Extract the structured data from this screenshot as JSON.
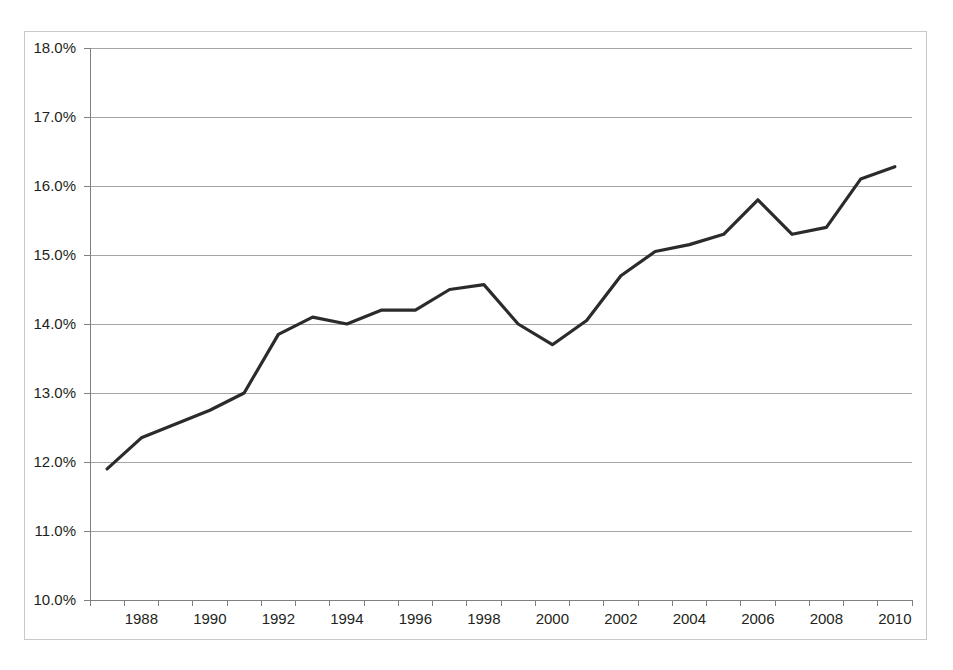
{
  "chart_data": {
    "type": "line",
    "title": "",
    "subtitle": "",
    "xlabel": "",
    "ylabel": "",
    "x": [
      1987,
      1988,
      1989,
      1990,
      1991,
      1992,
      1993,
      1994,
      1995,
      1996,
      1997,
      1998,
      1999,
      2000,
      2001,
      2002,
      2003,
      2004,
      2005,
      2006,
      2007,
      2008,
      2009,
      2010
    ],
    "values": [
      11.9,
      12.35,
      12.55,
      12.75,
      13.0,
      13.85,
      14.1,
      14.0,
      14.2,
      14.2,
      14.5,
      14.57,
      14.0,
      13.7,
      14.05,
      14.7,
      15.05,
      15.15,
      15.3,
      15.8,
      15.3,
      15.4,
      16.1,
      16.28
    ],
    "ylim": [
      10.0,
      18.0
    ],
    "ytick_values": [
      18.0,
      17.0,
      16.0,
      15.0,
      14.0,
      13.0,
      12.0,
      11.0,
      10.0
    ],
    "ytick_labels": [
      "18.0%",
      "17.0%",
      "16.0%",
      "15.0%",
      "14.0%",
      "13.0%",
      "12.0%",
      "11.0%",
      "10.0%"
    ],
    "xtick_labels": [
      "1988",
      "1990",
      "1992",
      "1994",
      "1996",
      "1998",
      "2000",
      "2002",
      "2004",
      "2006",
      "2008",
      "2010"
    ],
    "xtick_years": [
      1988,
      1990,
      1992,
      1994,
      1996,
      1998,
      2000,
      2002,
      2004,
      2006,
      2008,
      2010
    ],
    "grid": true,
    "legend": "none",
    "series_name": "",
    "colors": {
      "line": "#2b2b2b",
      "grid": "#a6a6a6",
      "axis": "#808080",
      "frame": "#c9c9c9",
      "text": "#231f20",
      "background": "#ffffff"
    },
    "line_width": 3.2
  }
}
